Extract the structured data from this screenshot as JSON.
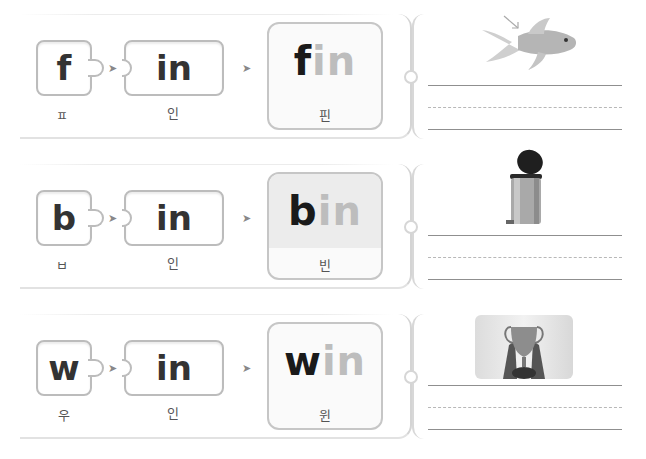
{
  "exercises": [
    {
      "onset": "f",
      "rime": "in",
      "onset_korean": "ㅍ",
      "rime_korean": "인",
      "word_onset": "f",
      "word_rime": "in",
      "word_korean": "핀",
      "arrow1": "➤",
      "arrow2": "➤",
      "picture": "goldfish-with-arrow-to-fin",
      "shaded": false
    },
    {
      "onset": "b",
      "rime": "in",
      "onset_korean": "ㅂ",
      "rime_korean": "인",
      "word_onset": "b",
      "word_rime": "in",
      "word_korean": "빈",
      "arrow1": "➤",
      "arrow2": "➤",
      "picture": "pedal-trash-bin",
      "shaded": true
    },
    {
      "onset": "w",
      "rime": "in",
      "onset_korean": "우",
      "rime_korean": "인",
      "word_onset": "w",
      "word_rime": "in",
      "word_korean": "윈",
      "arrow1": "➤",
      "arrow2": "➤",
      "picture": "hands-raising-trophy",
      "shaded": false
    }
  ],
  "colors": {
    "onset_text": "#1a1a1a",
    "rime_text": "#bdbdbd",
    "piece_border": "#bcbcbc",
    "shaded_bg": "#ececec"
  }
}
